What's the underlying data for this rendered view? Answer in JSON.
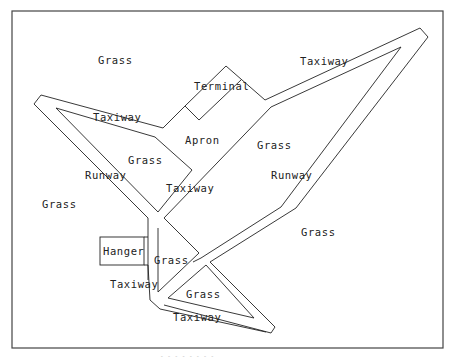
{
  "diagram": {
    "labels": {
      "grass_top_left": "Grass",
      "taxiway_top_right": "Taxiway",
      "terminal": "Terminal",
      "taxiway_left": "Taxiway",
      "apron": "Apron",
      "grass_center": "Grass",
      "grass_inner_left": "Grass",
      "runway_left": "Runway",
      "taxiway_center": "Taxiway",
      "runway_right": "Runway",
      "grass_far_left": "Grass",
      "grass_right": "Grass",
      "hanger": "Hanger",
      "grass_small_triangle": "Grass",
      "taxiway_lower_left": "Taxiway",
      "grass_bottom_triangle": "Grass",
      "taxiway_bottom": "Taxiway"
    },
    "caption": "-  -  -  -  -  -  -  -"
  }
}
